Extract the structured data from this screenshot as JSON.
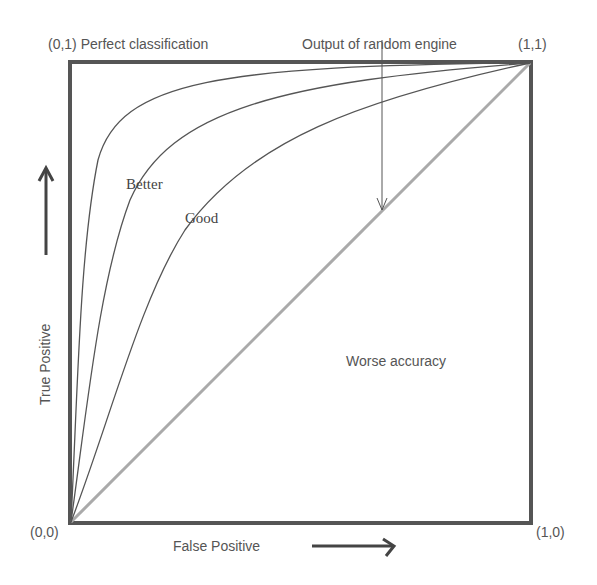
{
  "diagram": {
    "type": "ROC curve illustration",
    "corner_labels": {
      "top_left": "(0,1) Perfect classification",
      "top_right": "(1,1)",
      "bottom_left": "(0,0)",
      "bottom_right": "(1,0)"
    },
    "annotation_random": "Output of random engine",
    "curve_labels": {
      "better": "Better",
      "good": "Good"
    },
    "region_label": "Worse accuracy",
    "x_axis_label": "False Positive",
    "y_axis_label": "True Positive",
    "curves": [
      {
        "name": "near-perfect",
        "shape": "strongly concave",
        "color": "#555555"
      },
      {
        "name": "better",
        "shape": "concave",
        "color": "#555555"
      },
      {
        "name": "good",
        "shape": "mildly concave",
        "color": "#555555"
      },
      {
        "name": "random",
        "shape": "diagonal",
        "color": "#aaaaaa"
      }
    ],
    "colors": {
      "frame": "#555555",
      "curve": "#555555",
      "diagonal": "#aaaaaa",
      "text": "#555555"
    }
  }
}
